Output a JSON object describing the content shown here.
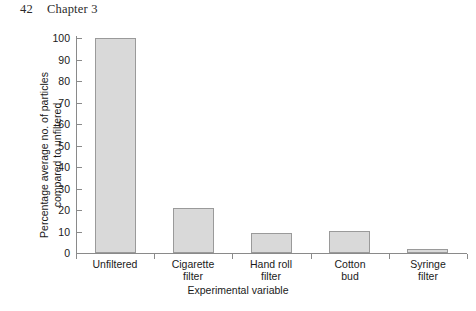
{
  "page": {
    "folio": "42",
    "running_head": "Chapter 3"
  },
  "figure": {
    "caption": ""
  },
  "chart_data": {
    "type": "bar",
    "title": "",
    "categories": [
      "Unfiltered",
      "Cigarette filter",
      "Hand roll filter",
      "Cotton bud",
      "Syringe filter"
    ],
    "category_lines": [
      [
        "Unfiltered"
      ],
      [
        "Cigarette",
        "filter"
      ],
      [
        "Hand roll",
        "filter"
      ],
      [
        "Cotton",
        "bud"
      ],
      [
        "Syringe",
        "filter"
      ]
    ],
    "values": [
      100,
      21,
      9.5,
      10,
      2
    ],
    "xlabel": "Experimental variable",
    "ylabel": "Percentage average no. of particles compared to unfiltered",
    "ylabel_lines": [
      "Percentage average no. of particles",
      "compared to unfiltered"
    ],
    "ylim": [
      0,
      100
    ],
    "yticks": [
      0,
      10,
      20,
      30,
      40,
      50,
      60,
      70,
      80,
      90,
      100
    ],
    "ytick_labels": [
      "0",
      "10",
      "20",
      "30",
      "40",
      "50",
      "60",
      "70",
      "80",
      "90",
      "100"
    ],
    "grid": false,
    "legend": false,
    "bar_fill": "#d9d9d9",
    "bar_edge": "#9a9a9a",
    "axis_color": "#8a8a8a"
  }
}
